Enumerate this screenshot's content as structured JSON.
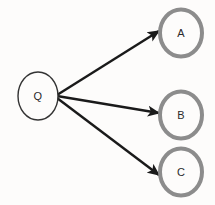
{
  "diagram": {
    "background_color": "#fdfcfb",
    "source_node": {
      "id": "Q",
      "label": "Q",
      "cx": 38,
      "cy": 96,
      "rx": 20,
      "ry": 24,
      "stroke_color": "#333333",
      "stroke_width": 1.4,
      "fill_color": "#fdfcfb",
      "label_color": "#2b2b2b"
    },
    "target_nodes": [
      {
        "id": "A",
        "label": "A",
        "cx": 181,
        "cy": 33,
        "rx": 21,
        "ry": 23.5,
        "stroke_color": "#8c8c8c",
        "stroke_width": 4,
        "fill_color": "#fdfcfb",
        "label_color": "#2b2b2b"
      },
      {
        "id": "B",
        "label": "B",
        "cx": 181,
        "cy": 115,
        "rx": 21,
        "ry": 23.5,
        "stroke_color": "#8c8c8c",
        "stroke_width": 4,
        "fill_color": "#fdfcfb",
        "label_color": "#2b2b2b"
      },
      {
        "id": "C",
        "label": "C",
        "cx": 181,
        "cy": 172,
        "rx": 21,
        "ry": 23.5,
        "stroke_color": "#8c8c8c",
        "stroke_width": 4,
        "fill_color": "#fdfcfb",
        "label_color": "#2b2b2b"
      }
    ],
    "edges": [
      {
        "id": "edge-q-a",
        "from": "Q",
        "to": "A",
        "x1": 57,
        "y1": 95,
        "x2": 159,
        "y2": 31,
        "color": "#1a1a1a",
        "width": 2.4,
        "arrowhead": "filled-triangle"
      },
      {
        "id": "edge-q-b",
        "from": "Q",
        "to": "B",
        "x1": 57,
        "y1": 96,
        "x2": 159,
        "y2": 113,
        "color": "#1a1a1a",
        "width": 2.4,
        "arrowhead": "filled-triangle"
      },
      {
        "id": "edge-q-c",
        "from": "Q",
        "to": "C",
        "x1": 57,
        "y1": 98,
        "x2": 159,
        "y2": 175,
        "color": "#1a1a1a",
        "width": 2.4,
        "arrowhead": "filled-triangle"
      }
    ]
  }
}
